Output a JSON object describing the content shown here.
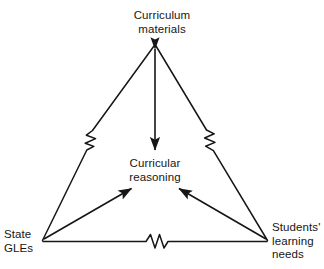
{
  "diagram": {
    "type": "triangle-relationship-diagram",
    "background_color": "#ffffff",
    "line_color": "#161616",
    "nodes": [
      {
        "id": "curriculum-materials",
        "label": "Curriculum\nmaterials",
        "position": "top-apex",
        "x": 155,
        "y": 25
      },
      {
        "id": "curricular-reasoning",
        "label": "Curricular\nreasoning",
        "position": "center",
        "x": 155,
        "y": 171
      },
      {
        "id": "state-gles",
        "label": "State\nGLEs",
        "position": "bottom-left",
        "x": 30,
        "y": 241
      },
      {
        "id": "students-learning-needs",
        "label": "Students'\nlearning\nneeds",
        "position": "bottom-right",
        "x": 288,
        "y": 241
      }
    ],
    "arrows": [
      {
        "id": "curriculum-materials-to-curricular-reasoning",
        "from": "curriculum-materials",
        "to": "curricular-reasoning",
        "direction": "down",
        "arrowheads": "both"
      },
      {
        "id": "state-gles-to-curricular-reasoning",
        "from": "state-gles",
        "to": "curricular-reasoning",
        "direction": "up-right",
        "arrowheads": "single"
      },
      {
        "id": "students-learning-needs-to-curricular-reasoning",
        "from": "students-learning-needs",
        "to": "curricular-reasoning",
        "direction": "up-left",
        "arrowheads": "single"
      }
    ],
    "edges": [
      {
        "id": "edge-left",
        "from": "curriculum-materials",
        "to": "state-gles",
        "break_symbol": "zigzag"
      },
      {
        "id": "edge-right",
        "from": "curriculum-materials",
        "to": "students-learning-needs",
        "break_symbol": "zigzag"
      },
      {
        "id": "edge-bottom",
        "from": "state-gles",
        "to": "students-learning-needs",
        "break_symbol": "zigzag"
      }
    ]
  }
}
